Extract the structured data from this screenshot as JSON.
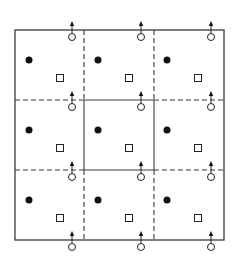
{
  "diagram": {
    "type": "periodic-grid-unit-cells",
    "grid": {
      "rows": 3,
      "cols": 3,
      "x_lines": [
        15,
        84,
        154,
        224
      ],
      "y_lines": [
        30,
        100,
        170,
        240
      ]
    },
    "line_color": "#3a3a3a",
    "markers": {
      "filled_circle": {
        "xs": [
          29,
          98,
          167
        ],
        "ys": [
          60,
          130,
          200
        ],
        "r": 3.5
      },
      "open_square": {
        "xs": [
          60,
          129,
          198
        ],
        "ys": [
          78,
          148,
          218
        ],
        "size": 7
      },
      "open_circle_arrow": {
        "xs": [
          72,
          141,
          211
        ],
        "ys": [
          37,
          107,
          177,
          247
        ],
        "r": 3.5,
        "arrow_len": 14
      }
    }
  }
}
